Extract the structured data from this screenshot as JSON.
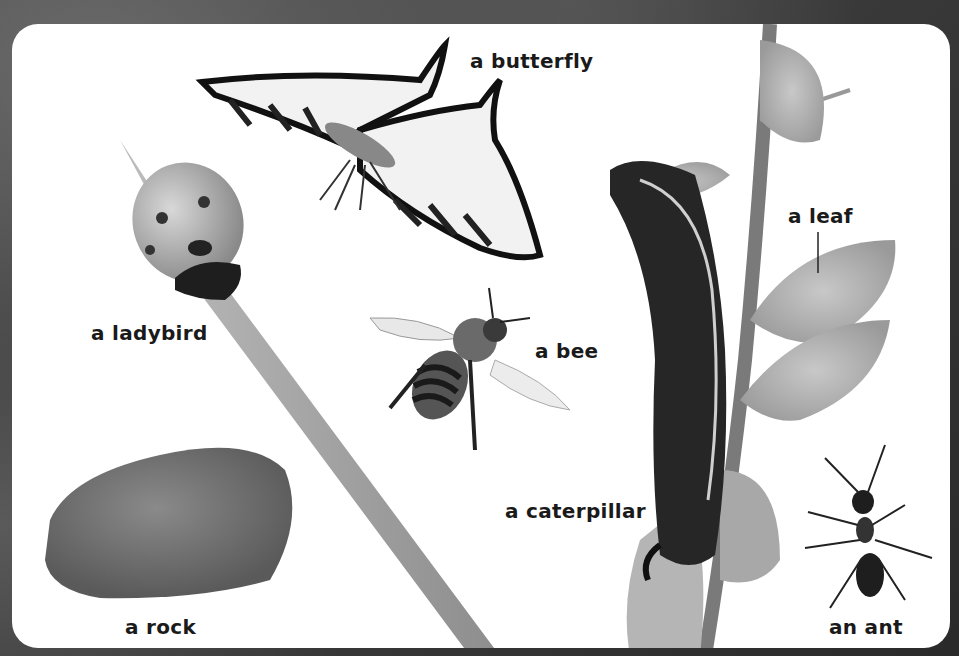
{
  "page": {
    "style": "grayscale picture book page",
    "items": [
      {
        "id": "butterfly",
        "label": "a butterfly"
      },
      {
        "id": "ladybird",
        "label": "a ladybird"
      },
      {
        "id": "bee",
        "label": "a bee"
      },
      {
        "id": "leaf",
        "label": "a leaf"
      },
      {
        "id": "caterpillar",
        "label": "a caterpillar"
      },
      {
        "id": "rock",
        "label": "a rock"
      },
      {
        "id": "ant",
        "label": "an ant"
      }
    ]
  }
}
